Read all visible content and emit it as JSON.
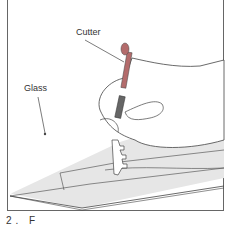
{
  "figure": {
    "labels": {
      "cutter": "Cutter",
      "glass": "Glass"
    },
    "caption_partial": "2. F",
    "colors": {
      "glass_fill": "#e6e6e6",
      "line": "#444444",
      "cutter_handle": "#b36b6b",
      "cutter_grip": "#555555"
    }
  }
}
